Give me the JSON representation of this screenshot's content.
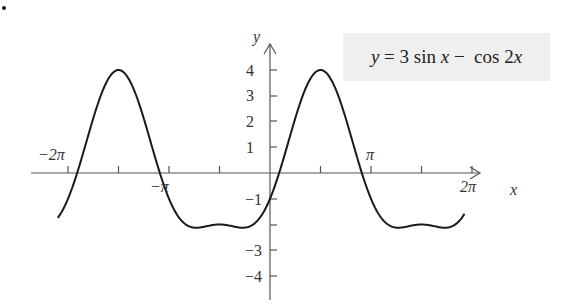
{
  "chart_data": {
    "type": "line",
    "title": "y = 3 sin x − cos 2x",
    "function": "3*sin(x) - cos(2*x)",
    "xlabel": "x",
    "ylabel": "y",
    "xlim": [
      -6.6,
      6.05
    ],
    "ylim": [
      -4.4,
      4.6
    ],
    "x_tick_labels": [
      "−2π",
      "−π",
      "π",
      "2π"
    ],
    "x_tick_values": [
      -6.2832,
      -3.1416,
      3.1416,
      6.2832
    ],
    "x_minor_ticks_step": "π/2",
    "y_tick_labels": [
      "4",
      "3",
      "2",
      "1",
      "−1",
      "−3",
      "−4"
    ],
    "y_tick_values": [
      4,
      3,
      2,
      1,
      -1,
      -3,
      -4
    ],
    "grid": false,
    "series": [
      {
        "name": "y = 3 sin x − cos 2x",
        "x": [
          -6.6,
          -6.2832,
          -5.5,
          -4.7124,
          -3.9,
          -3.1416,
          -2.5,
          -1.5708,
          -0.7,
          0,
          0.4,
          1.5708,
          2.7,
          3.1416,
          3.8,
          4.7124,
          5.6,
          6.05
        ],
        "y": [
          -1.18,
          -1.0,
          1.92,
          4.0,
          2.18,
          -1.0,
          -1.96,
          -2.0,
          -2.11,
          -1.0,
          0.5,
          4.0,
          0.6,
          -1.0,
          -2.06,
          -2.0,
          -2.11,
          -1.3
        ]
      }
    ],
    "legend": "none; formula shown in shaded box top-right",
    "annotations": [
      "y = 3 sin x − cos 2x"
    ]
  },
  "labels": {
    "formula_y": "y",
    "formula_eq": " = 3 sin ",
    "formula_x": "x",
    "formula_minus": " −  cos 2",
    "formula_x2": "x",
    "axis_x": "x",
    "axis_y": "y",
    "neg_two_pi": "−2π",
    "neg_pi": "−π",
    "pi": "π",
    "two_pi": "2π",
    "y4": "4",
    "y3": "3",
    "y2": "2",
    "y1": "1",
    "ym1": "−1",
    "ym3": "−3",
    "ym4": "−4"
  }
}
